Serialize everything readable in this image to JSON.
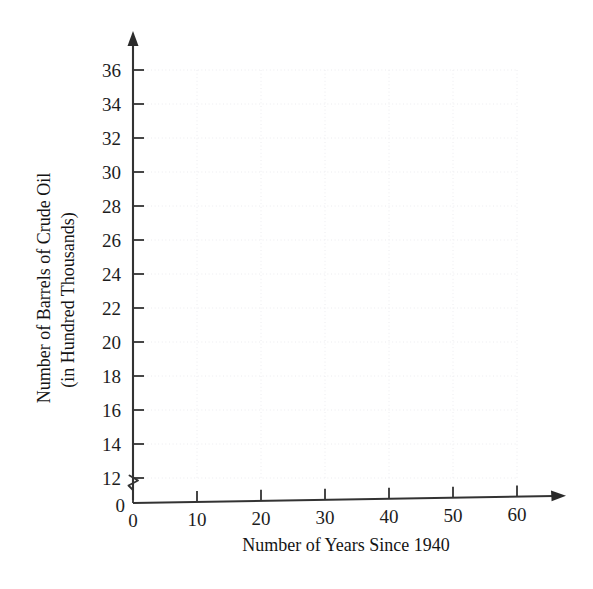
{
  "chart_data": {
    "type": "scatter",
    "title": "",
    "subtitle": "",
    "xlabel": "Number of Years Since 1940",
    "ylabel_line1": "Number of Barrels of Crude Oil",
    "ylabel_line2": "(in Hundred Thousands)",
    "x": [],
    "values": [],
    "series": [],
    "annotations": [],
    "legend": [],
    "legend_position": "none",
    "grid": true,
    "grid_color": "#ececef",
    "axis_color": "#333333",
    "background_color": "#ffffff",
    "xlim": [
      0,
      60
    ],
    "ylim": [
      12,
      36
    ],
    "x_ticks": [
      0,
      10,
      20,
      30,
      40,
      50,
      60
    ],
    "y_ticks": [
      12,
      14,
      16,
      18,
      20,
      22,
      24,
      26,
      28,
      30,
      32,
      34,
      36
    ],
    "y_origin_label": "0",
    "y_axis_break": true,
    "y_axis_break_note": "zigzag break between 0 and 12",
    "x_tick_labels": [
      "0",
      "10",
      "20",
      "30",
      "40",
      "50",
      "60"
    ],
    "y_tick_labels": [
      "12",
      "14",
      "16",
      "18",
      "20",
      "22",
      "24",
      "26",
      "28",
      "30",
      "32",
      "34",
      "36"
    ],
    "x_axis_arrow": true,
    "y_axis_arrow": true,
    "data_points_present": false
  }
}
